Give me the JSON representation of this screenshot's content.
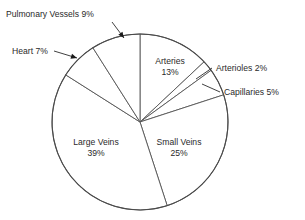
{
  "chart_data": {
    "type": "pie",
    "title": "",
    "xlabel": "",
    "ylabel": "",
    "units": "percent",
    "legend_position": "none",
    "grid": false,
    "total": 100,
    "start_angle_deg": 0,
    "direction": "clockwise",
    "center": {
      "x": 140,
      "y": 122
    },
    "radius": 88,
    "categories": [
      "Arteries",
      "Arterioles",
      "Capillaries",
      "Small Veins",
      "Large Veins",
      "Heart",
      "Pulmonary Vessels"
    ],
    "values": [
      13,
      2,
      5,
      25,
      39,
      7,
      9
    ],
    "slices": [
      {
        "label": "Arteries",
        "value": 13,
        "value_text": "13%",
        "label_placement": "inside",
        "label_x": 170,
        "label_y": 64,
        "label_line_1": "Arteries",
        "label_line_2": "13%"
      },
      {
        "label": "Arterioles",
        "value": 2,
        "value_text": "2%",
        "label_placement": "outside",
        "label_text": "Arterioles 2%",
        "label_x": 216,
        "label_y": 71,
        "leader": {
          "x1": 212,
          "y1": 68,
          "x2": 196,
          "y2": 79
        },
        "arrow": false
      },
      {
        "label": "Capillaries",
        "value": 5,
        "value_text": "5%",
        "label_placement": "outside",
        "label_text": "Capillaries 5%",
        "label_x": 224,
        "label_y": 95,
        "leader": {
          "x1": 220,
          "y1": 92,
          "x2": 202,
          "y2": 84
        },
        "arrow": false
      },
      {
        "label": "Small Veins",
        "value": 25,
        "value_text": "25%",
        "label_placement": "inside",
        "label_x": 179,
        "label_y": 145,
        "label_line_1": "Small Veins",
        "label_line_2": "25%"
      },
      {
        "label": "Large Veins",
        "value": 39,
        "value_text": "39%",
        "label_placement": "inside",
        "label_x": 96,
        "label_y": 145,
        "label_line_1": "Large Veins",
        "label_line_2": "39%"
      },
      {
        "label": "Heart",
        "value": 7,
        "value_text": "7%",
        "label_placement": "outside",
        "label_text": "Heart 7%",
        "label_x": 12,
        "label_y": 54,
        "leader": {
          "x1": 54,
          "y1": 51,
          "x2": 77,
          "y2": 58
        },
        "arrow": true
      },
      {
        "label": "Pulmonary Vessels",
        "value": 9,
        "value_text": "9%",
        "label_placement": "outside",
        "label_text": "Pulmonary Vessels 9%",
        "label_x": 6,
        "label_y": 17,
        "leader": {
          "x1": 112,
          "y1": 22,
          "x2": 124,
          "y2": 38
        },
        "arrow": true
      }
    ],
    "colors": {
      "slice_fill": "#ffffff",
      "slice_stroke": "#555555",
      "outline": "#4a4a4a",
      "text": "#2a2a2a",
      "leader": "#2b2b2b",
      "background": "#ffffff"
    }
  }
}
